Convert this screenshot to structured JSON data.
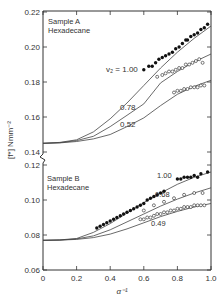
{
  "chart_data": {
    "type": "line",
    "title": "",
    "xlabel": "α⁻¹",
    "ylabel": "[f*] Nmm⁻²",
    "xlim": [
      0,
      1.0
    ],
    "x_ticks": [
      "0",
      "0.2",
      "0.4",
      "0.6",
      "0.8",
      "1.0"
    ],
    "grid": false,
    "broken_y_axis": true,
    "panels": [
      {
        "name": "upper",
        "annotation": [
          "Sample A",
          "Hexadecane"
        ],
        "ylim": [
          0.14,
          0.22
        ],
        "y_ticks": [
          "0.14",
          "0.16",
          "0.18",
          "0.20",
          "0.22"
        ],
        "curves": [
          {
            "label": "v₂ = 1.00",
            "x": [
              0,
              0.1,
              0.2,
              0.3,
              0.4,
              0.5,
              0.6,
              0.7,
              0.8,
              0.9,
              1.0
            ],
            "y": [
              0.145,
              0.1455,
              0.147,
              0.1515,
              0.159,
              0.168,
              0.178,
              0.188,
              0.197,
              0.205,
              0.212
            ]
          },
          {
            "label": "0.78",
            "x": [
              0,
              0.1,
              0.2,
              0.3,
              0.4,
              0.5,
              0.6,
              0.7,
              0.8,
              0.9,
              1.0
            ],
            "y": [
              0.145,
              0.1453,
              0.1465,
              0.149,
              0.1545,
              0.161,
              0.1675,
              0.1795,
              0.186,
              0.1915,
              0.196
            ]
          },
          {
            "label": "0.52",
            "x": [
              0,
              0.1,
              0.2,
              0.3,
              0.4,
              0.5,
              0.6,
              0.7,
              0.8,
              0.9,
              1.0
            ],
            "y": [
              0.145,
              0.1452,
              0.146,
              0.1475,
              0.15,
              0.1545,
              0.1595,
              0.1665,
              0.173,
              0.1775,
              0.181
            ]
          }
        ],
        "series": [
          {
            "name": "v₂ = 1.00 (filled)",
            "marker": "filled-circle",
            "x": [
              0.6,
              0.63,
              0.65,
              0.67,
              0.69,
              0.71,
              0.73,
              0.75,
              0.77,
              0.79,
              0.81,
              0.83,
              0.85,
              0.86,
              0.88,
              0.9,
              0.92,
              0.94,
              0.96,
              0.98
            ],
            "y": [
              0.187,
              0.189,
              0.189,
              0.191,
              0.193,
              0.194,
              0.195,
              0.196,
              0.197,
              0.199,
              0.2,
              0.202,
              0.204,
              0.204,
              0.206,
              0.207,
              0.208,
              0.21,
              0.211,
              0.213
            ]
          },
          {
            "name": "v₂ = 0.78 (open)",
            "marker": "open-circle",
            "x": [
              0.68,
              0.71,
              0.73,
              0.75,
              0.77,
              0.79,
              0.81,
              0.83,
              0.85,
              0.87,
              0.89,
              0.91,
              0.93,
              0.95
            ],
            "y": [
              0.183,
              0.184,
              0.185,
              0.186,
              0.186,
              0.187,
              0.188,
              0.188,
              0.19,
              0.19,
              0.191,
              0.192,
              0.193,
              0.191
            ]
          },
          {
            "name": "v₂ = 0.52 (open)",
            "marker": "open-circle",
            "x": [
              0.78,
              0.8,
              0.82,
              0.84,
              0.86,
              0.88,
              0.9,
              0.92,
              0.94,
              0.96
            ],
            "y": [
              0.174,
              0.175,
              0.175,
              0.176,
              0.176,
              0.177,
              0.177,
              0.177,
              0.178,
              0.178
            ]
          }
        ]
      },
      {
        "name": "lower",
        "annotation": [
          "Sample B",
          "Hexadecane"
        ],
        "ylim": [
          0.06,
          0.12
        ],
        "y_ticks": [
          "0.06",
          "0.08",
          "0.10",
          "0.12"
        ],
        "curves": [
          {
            "label": "1.00",
            "x": [
              0,
              0.1,
              0.2,
              0.3,
              0.4,
              0.5,
              0.6,
              0.7,
              0.8,
              0.9,
              1.0
            ],
            "y": [
              0.077,
              0.0772,
              0.078,
              0.0815,
              0.0865,
              0.0925,
              0.0985,
              0.104,
              0.109,
              0.113,
              0.116
            ]
          },
          {
            "label": "0.68",
            "x": [
              0,
              0.1,
              0.2,
              0.3,
              0.4,
              0.5,
              0.6,
              0.7,
              0.8,
              0.9,
              1.0
            ],
            "y": [
              0.077,
              0.0771,
              0.0778,
              0.0795,
              0.083,
              0.0875,
              0.092,
              0.0965,
              0.1005,
              0.104,
              0.107
            ]
          },
          {
            "label": "0.49",
            "x": [
              0,
              0.1,
              0.2,
              0.3,
              0.4,
              0.5,
              0.6,
              0.7,
              0.8,
              0.9,
              1.0
            ],
            "y": [
              0.077,
              0.0771,
              0.0775,
              0.0785,
              0.0805,
              0.0835,
              0.087,
              0.0905,
              0.0935,
              0.096,
              0.098
            ]
          }
        ],
        "series": [
          {
            "name": "v₂ = 1.00 (filled)",
            "marker": "filled-circle",
            "x": [
              0.32,
              0.34,
              0.36,
              0.38,
              0.4,
              0.42,
              0.44,
              0.46,
              0.48,
              0.5,
              0.52,
              0.54,
              0.56,
              0.58,
              0.6,
              0.62,
              0.64,
              0.66,
              0.68,
              0.7,
              0.72,
              0.8,
              0.82,
              0.84,
              0.86,
              0.88,
              0.9,
              0.92,
              0.94,
              0.98
            ],
            "y": [
              0.084,
              0.085,
              0.086,
              0.087,
              0.088,
              0.089,
              0.09,
              0.091,
              0.092,
              0.093,
              0.094,
              0.095,
              0.096,
              0.097,
              0.098,
              0.1,
              0.101,
              0.102,
              0.103,
              0.104,
              0.105,
              0.112,
              0.112,
              0.113,
              0.113,
              0.113,
              0.114,
              0.113,
              0.115,
              0.116
            ]
          },
          {
            "name": "v₂ = 0.68 (open)",
            "marker": "open-circle",
            "x": [
              0.6,
              0.66,
              0.72,
              0.78,
              0.84,
              0.9,
              0.95
            ],
            "y": [
              0.094,
              0.097,
              0.099,
              0.101,
              0.103,
              0.104,
              0.104
            ]
          },
          {
            "name": "v₂ = 0.49 (open)",
            "marker": "open-circle",
            "x": [
              0.58,
              0.6,
              0.62,
              0.64,
              0.66,
              0.68,
              0.7,
              0.72,
              0.74,
              0.76,
              0.78,
              0.8,
              0.82,
              0.84,
              0.86,
              0.88,
              0.9,
              0.92,
              0.94,
              0.96
            ],
            "y": [
              0.089,
              0.089,
              0.09,
              0.09,
              0.091,
              0.092,
              0.092,
              0.093,
              0.093,
              0.094,
              0.094,
              0.095,
              0.095,
              0.096,
              0.096,
              0.096,
              0.097,
              0.097,
              0.097,
              0.097
            ]
          }
        ]
      }
    ]
  },
  "labels": {
    "upper_annotation_1": "Sample A",
    "upper_annotation_2": "Hexadecane",
    "lower_annotation_1": "Sample B",
    "lower_annotation_2": "Hexadecane",
    "curve_a_100": "v₂ = 1.00",
    "curve_a_078": "0.78",
    "curve_a_052": "0.52",
    "curve_b_100": "1.00",
    "curve_b_068": "0.68",
    "curve_b_049": "0.49",
    "xlabel": "α⁻¹",
    "ylabel": "[f*] Nmm⁻²"
  }
}
